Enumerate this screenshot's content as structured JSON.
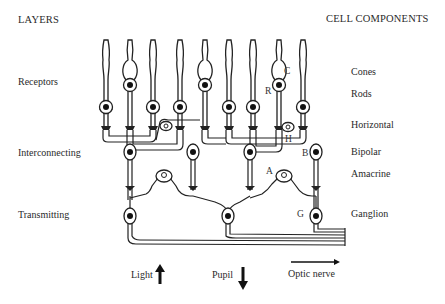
{
  "headers": {
    "left": "LAYERS",
    "right": "CELL COMPONENTS"
  },
  "layers": [
    {
      "label": "Receptors"
    },
    {
      "label": "Interconnecting"
    },
    {
      "label": "Transmitting"
    }
  ],
  "cell_components": [
    {
      "label": "Cones"
    },
    {
      "label": "Rods"
    },
    {
      "label": "Horizontal"
    },
    {
      "label": "Bipolar"
    },
    {
      "label": "Amacrine"
    },
    {
      "label": "Ganglion"
    }
  ],
  "cell_letters": {
    "cone": "C",
    "rod": "R",
    "horizontal": "H",
    "bipolar": "B",
    "amacrine": "A",
    "ganglion": "G"
  },
  "direction_labels": {
    "light": "Light",
    "pupil": "Pupil",
    "optic_nerve": "Optic nerve"
  },
  "icons": {
    "light": "arrow-up-icon",
    "pupil": "arrow-down-icon",
    "optic_nerve": "arrow-right-icon"
  }
}
